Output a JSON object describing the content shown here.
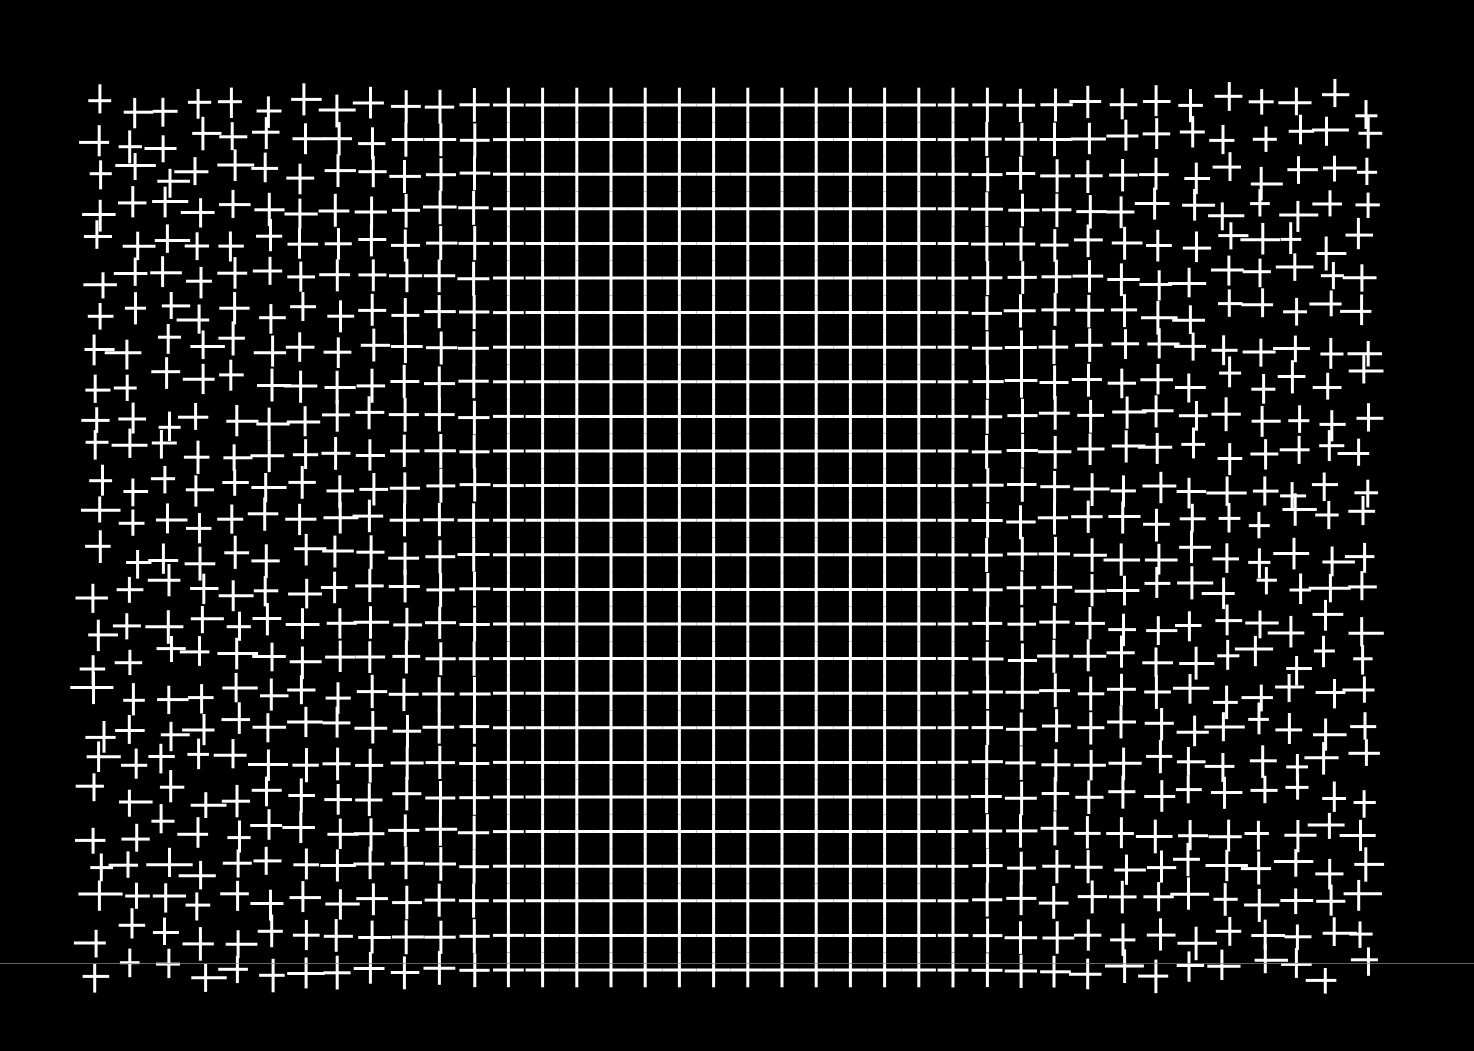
{
  "image": {
    "description": "Distorted white grid pattern on black background; regular square grid in center, fragmented staggered crosses toward left and right edges",
    "background_color": "#000000",
    "line_color": "#ffffff"
  },
  "grid": {
    "x_start": 98,
    "y_start": 105,
    "col_spacing": 34.2,
    "row_spacing": 34.6,
    "cols": 39,
    "rows": 26,
    "line_width": 3,
    "regular_region": {
      "x_from": 510,
      "x_to": 950
    },
    "left_edge": 82,
    "right_edge": 1394,
    "top_edge": 88,
    "bottom_edge": 988
  },
  "artifacts": {
    "scanline_y": 963,
    "scanline_color": "#8a8a8a"
  }
}
